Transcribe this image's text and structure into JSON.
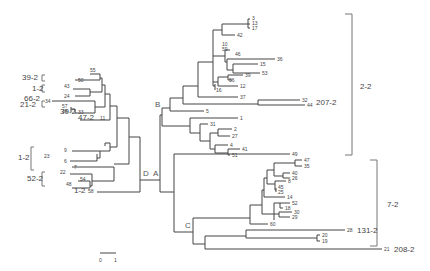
{
  "figure": {
    "type": "phylogenetic-tree",
    "nodes": {
      "A": "A",
      "B": "B",
      "C": "C",
      "D": "D"
    },
    "scale_bar": {
      "start": "0",
      "end": "1"
    },
    "groups": {
      "g2_2": "2-2",
      "g7_2": "7-2",
      "g207_2": "207-2",
      "g131_2": "131-2",
      "g208_2": "208-2",
      "g39_2a": "39-2",
      "g1_2a": "1-2",
      "g66_2": "66-2",
      "g21_2": "21-2",
      "g39_2b": "39-2",
      "g47_2": "47-2",
      "g1_2b": "1-2",
      "g52_2": "52-2",
      "g1_2c": "1-2"
    },
    "leaves_B": [
      "3",
      "13",
      "17",
      "42",
      "10",
      "59",
      "46",
      "36",
      "15",
      "53",
      "39",
      "56",
      "12",
      "16",
      "37",
      "32",
      "44",
      "5",
      "1",
      "31",
      "2",
      "27",
      "4",
      "41",
      "51"
    ],
    "leaves_C": [
      "49",
      "47",
      "35",
      "40",
      "26",
      "8",
      "45",
      "25",
      "14",
      "52",
      "18",
      "30",
      "29",
      "60",
      "28",
      "20",
      "19",
      "21"
    ],
    "leaves_D": [
      "55",
      "50",
      "43",
      "24",
      "34",
      "57",
      "38",
      "33",
      "11",
      "9",
      "23",
      "6",
      "7",
      "22",
      "54",
      "48",
      "58"
    ]
  }
}
